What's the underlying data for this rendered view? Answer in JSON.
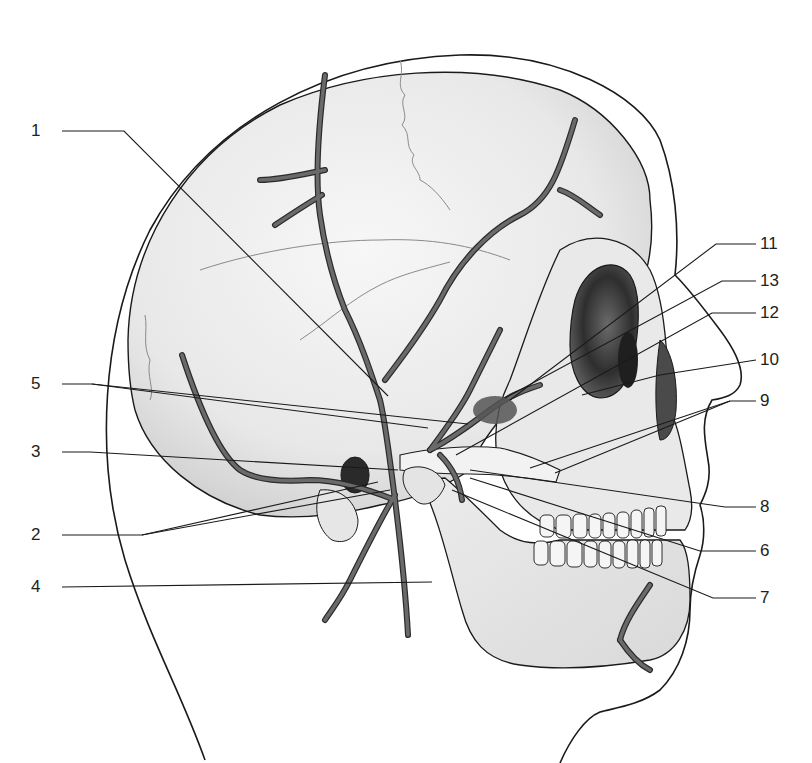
{
  "diagram": {
    "colors": {
      "outline": "#1a1a1a",
      "bone_fill": "#efefef",
      "bone_shadow": "#d6d6d6",
      "orbit_dark": "#3a3a3a",
      "artery": "#5a5a5a",
      "artery_edge": "#2a2a2a",
      "suture": "#8a8a8a",
      "leader": "#1a1a1a",
      "background": "#ffffff"
    },
    "labels": [
      {
        "id": "1",
        "text": "1",
        "side": "left",
        "x": 45,
        "y": 131,
        "line": [
          [
            62,
            131
          ],
          [
            124,
            131
          ],
          [
            388,
            396
          ]
        ]
      },
      {
        "id": "5",
        "text": "5",
        "side": "left",
        "x": 45,
        "y": 384,
        "line": [
          [
            62,
            384
          ],
          [
            92,
            384
          ],
          [
            428,
            428
          ]
        ],
        "line2": [
          [
            92,
            384
          ],
          [
            468,
            424
          ]
        ]
      },
      {
        "id": "3",
        "text": "3",
        "side": "left",
        "x": 45,
        "y": 452,
        "line": [
          [
            62,
            452
          ],
          [
            90,
            452
          ],
          [
            398,
            470
          ]
        ]
      },
      {
        "id": "2",
        "text": "2",
        "side": "left",
        "x": 45,
        "y": 535,
        "line": [
          [
            62,
            535
          ],
          [
            142,
            535
          ],
          [
            378,
            482
          ]
        ],
        "line2": [
          [
            142,
            535
          ],
          [
            390,
            490
          ]
        ]
      },
      {
        "id": "4",
        "text": "4",
        "side": "left",
        "x": 45,
        "y": 587,
        "line": [
          [
            62,
            587
          ],
          [
            432,
            582
          ]
        ]
      },
      {
        "id": "11",
        "text": "11",
        "side": "right",
        "x": 760,
        "y": 244,
        "line": [
          [
            756,
            244
          ],
          [
            716,
            244
          ],
          [
            510,
            400
          ]
        ]
      },
      {
        "id": "13",
        "text": "13",
        "side": "right",
        "x": 760,
        "y": 281,
        "line": [
          [
            756,
            281
          ],
          [
            722,
            281
          ],
          [
            505,
            398
          ]
        ]
      },
      {
        "id": "12",
        "text": "12",
        "side": "right",
        "x": 760,
        "y": 313,
        "line": [
          [
            756,
            313
          ],
          [
            712,
            313
          ],
          [
            456,
            455
          ]
        ]
      },
      {
        "id": "10",
        "text": "10",
        "side": "right",
        "x": 760,
        "y": 360,
        "line": [
          [
            756,
            360
          ],
          [
            660,
            375
          ],
          [
            582,
            395
          ]
        ]
      },
      {
        "id": "9",
        "text": "9",
        "side": "right",
        "x": 760,
        "y": 401,
        "line": [
          [
            756,
            401
          ],
          [
            730,
            401
          ],
          [
            530,
            468
          ]
        ],
        "line2": [
          [
            730,
            401
          ],
          [
            555,
            473
          ]
        ]
      },
      {
        "id": "8",
        "text": "8",
        "side": "right",
        "x": 760,
        "y": 507,
        "line": [
          [
            756,
            507
          ],
          [
            725,
            507
          ],
          [
            470,
            470
          ]
        ]
      },
      {
        "id": "6",
        "text": "6",
        "side": "right",
        "x": 760,
        "y": 551,
        "line": [
          [
            756,
            551
          ],
          [
            700,
            551
          ],
          [
            470,
            478
          ]
        ]
      },
      {
        "id": "7",
        "text": "7",
        "side": "right",
        "x": 760,
        "y": 598,
        "line": [
          [
            756,
            598
          ],
          [
            713,
            598
          ],
          [
            452,
            490
          ]
        ]
      }
    ]
  }
}
